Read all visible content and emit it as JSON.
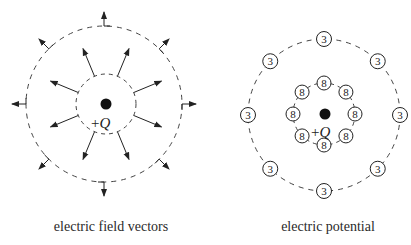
{
  "panels": [
    {
      "id": "field",
      "caption": "electric field vectors",
      "charge": {
        "label_sign": "+",
        "label_symbol": "Q",
        "cx": 106,
        "cy": 104
      },
      "inner_circle_radius": 30,
      "outer_circle_radius": 78,
      "inner_arrow_count": 8,
      "outer_arrow_count": 8
    },
    {
      "id": "potential",
      "caption": "electric potential",
      "charge": {
        "label_sign": "+",
        "label_symbol": "Q",
        "cx": 324,
        "cy": 114
      },
      "inner_ring": {
        "radius": 31,
        "value": "8",
        "count": 8
      },
      "outer_ring": {
        "radius": 76,
        "value": "3",
        "count": 8
      }
    }
  ],
  "colors": {
    "ink": "#222222",
    "dash": "#444444",
    "background": "#ffffff"
  }
}
